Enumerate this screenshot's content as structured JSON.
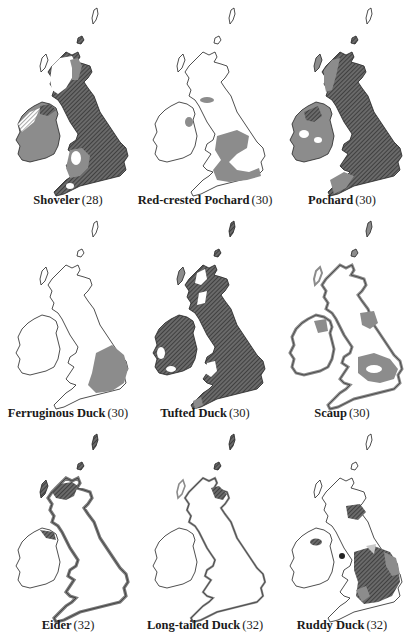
{
  "colors": {
    "land": "#ffffff",
    "outline": "#2a2a2a",
    "grey": "#8c8c8c",
    "dark": "#5a5a5a",
    "hatch_light": "#b0b0b0"
  },
  "legend_semantics": {
    "hatched_dark": "dense-hatched-area",
    "grey": "grey-shaded-area",
    "light_hatch": "light-hatched-area",
    "white": "unshaded-area"
  },
  "maps": [
    {
      "name": "Shoveler",
      "number": "(28)"
    },
    {
      "name": "Red-crested Pochard",
      "number": "(30)"
    },
    {
      "name": "Pochard",
      "number": "(30)"
    },
    {
      "name": "Ferruginous Duck",
      "number": "(30)"
    },
    {
      "name": "Tufted Duck",
      "number": "(30)"
    },
    {
      "name": "Scaup",
      "number": "(30)"
    },
    {
      "name": "Eider",
      "number": "(32)"
    },
    {
      "name": "Long-tailed Duck",
      "number": "(32)"
    },
    {
      "name": "Ruddy Duck",
      "number": "(32)"
    }
  ]
}
